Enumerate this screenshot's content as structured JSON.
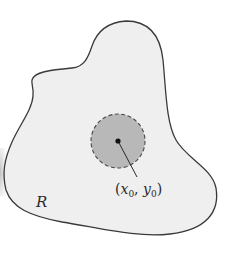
{
  "diagram": {
    "region": {
      "label": "R",
      "fill": "#efefef",
      "stroke": "#3a3a3a"
    },
    "disk": {
      "fill": "#b8b8b8",
      "stroke": "#4a4a4a",
      "border_style": "dashed"
    },
    "point": {
      "label_open": "(",
      "x_var": "x",
      "x_sub": "0",
      "separator": ", ",
      "y_var": "y",
      "y_sub": "0",
      "label_close": ")",
      "color": "#111111"
    },
    "edge_shadow": "#c8c8c8"
  }
}
